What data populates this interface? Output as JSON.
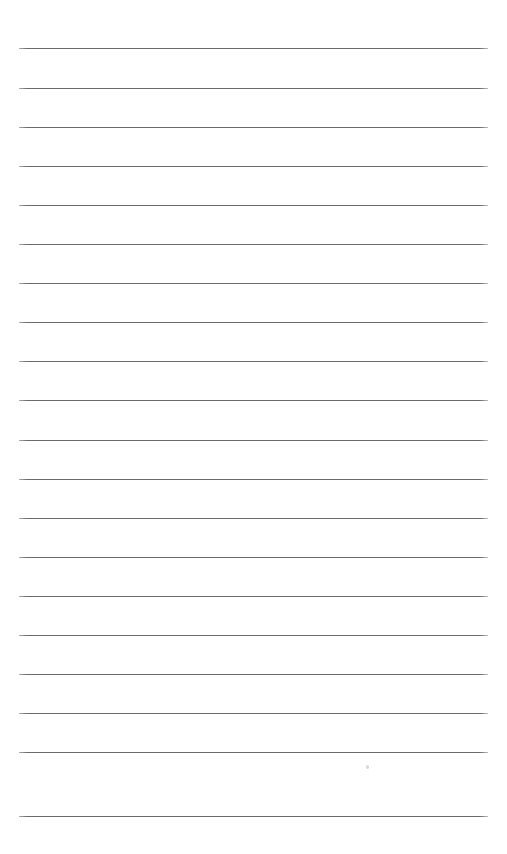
{
  "page": {
    "kind": "ruled-paper-sheet",
    "width": 507,
    "height": 854,
    "background_color": "#ffffff",
    "orientation": "portrait",
    "content_text": ""
  },
  "ruling": {
    "label": "Horizontal ruled lines",
    "line_color": "#6b6b6b",
    "line_thickness_px": 1,
    "line_count": 20,
    "left_margin_px": 19,
    "right_margin_px": 488,
    "line_length_px": 469,
    "first_line_y_px": 48,
    "last_line_y_px": 816,
    "line_spacing_px": 39.3,
    "has_vertical_margin_rule": false,
    "has_holes": false,
    "lines": [
      {
        "index": 1,
        "y": 48,
        "label": "rule-line-1"
      },
      {
        "index": 2,
        "y": 88,
        "label": "rule-line-2"
      },
      {
        "index": 3,
        "y": 127,
        "label": "rule-line-3"
      },
      {
        "index": 4,
        "y": 166,
        "label": "rule-line-4"
      },
      {
        "index": 5,
        "y": 205,
        "label": "rule-line-5"
      },
      {
        "index": 6,
        "y": 244,
        "label": "rule-line-6"
      },
      {
        "index": 7,
        "y": 283,
        "label": "rule-line-7"
      },
      {
        "index": 8,
        "y": 322,
        "label": "rule-line-8"
      },
      {
        "index": 9,
        "y": 361,
        "label": "rule-line-9"
      },
      {
        "index": 10,
        "y": 400,
        "label": "rule-line-10"
      },
      {
        "index": 11,
        "y": 440,
        "label": "rule-line-11"
      },
      {
        "index": 12,
        "y": 479,
        "label": "rule-line-12"
      },
      {
        "index": 13,
        "y": 518,
        "label": "rule-line-13"
      },
      {
        "index": 14,
        "y": 557,
        "label": "rule-line-14"
      },
      {
        "index": 15,
        "y": 596,
        "label": "rule-line-15"
      },
      {
        "index": 16,
        "y": 635,
        "label": "rule-line-16"
      },
      {
        "index": 17,
        "y": 674,
        "label": "rule-line-17"
      },
      {
        "index": 18,
        "y": 713,
        "label": "rule-line-18"
      },
      {
        "index": 19,
        "y": 752,
        "label": "rule-line-19"
      },
      {
        "index": 20,
        "y": 816,
        "label": "rule-line-20"
      }
    ]
  },
  "marks": [
    {
      "label": "faint-pencil-dot",
      "x": 366,
      "y": 765,
      "color": "#d2d2d2",
      "description": "very faint stray pencil mark"
    }
  ]
}
